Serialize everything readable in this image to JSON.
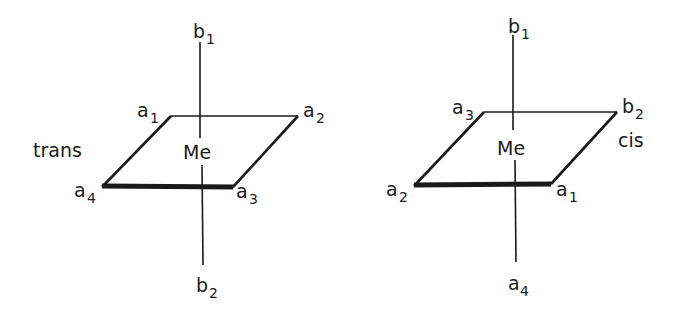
{
  "diagrams": [
    {
      "name": "trans",
      "label": "trans",
      "center": "Me",
      "axis_top": {
        "base": "b",
        "sub": "1"
      },
      "axis_bottom": {
        "base": "b",
        "sub": "2"
      },
      "corners": {
        "back_left": {
          "base": "a",
          "sub": "1"
        },
        "back_right": {
          "base": "a",
          "sub": "2"
        },
        "front_right": {
          "base": "a",
          "sub": "3"
        },
        "front_left": {
          "base": "a",
          "sub": "4"
        }
      }
    },
    {
      "name": "cis",
      "label": "cis",
      "center": "Me",
      "axis_top": {
        "base": "b",
        "sub": "1"
      },
      "axis_bottom": {
        "base": "a",
        "sub": "4"
      },
      "corners": {
        "back_left": {
          "base": "a",
          "sub": "3"
        },
        "back_right": {
          "base": "b",
          "sub": "2"
        },
        "front_right": {
          "base": "a",
          "sub": "1"
        },
        "front_left": {
          "base": "a",
          "sub": "2"
        }
      }
    }
  ],
  "colors": {
    "ink": "#1a1a1a",
    "background": "#ffffff"
  }
}
